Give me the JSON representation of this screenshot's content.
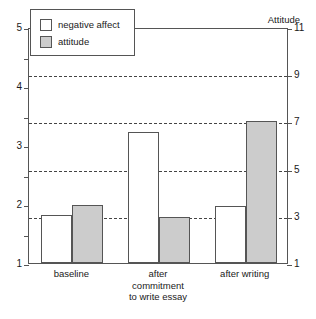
{
  "chart_data": {
    "type": "bar",
    "title": "",
    "categories": [
      "baseline",
      "after\ncommitment\nto write essay",
      "after writing"
    ],
    "series": [
      {
        "name": "negative affect",
        "axis": "left",
        "values": [
          1.82,
          3.22,
          1.97
        ],
        "fill": "#ffffff"
      },
      {
        "name": "attitude",
        "axis": "right",
        "values": [
          3.45,
          2.95,
          7.0
        ],
        "fill": "#cccccc"
      }
    ],
    "left_axis": {
      "label": "Negative Affect",
      "ticks": [
        5,
        4,
        3,
        2,
        1
      ],
      "minor_ticks": [
        4.5,
        3.5,
        2.5,
        1.5
      ],
      "ylim": [
        1,
        5
      ]
    },
    "right_axis": {
      "label": "Attitude",
      "ticks": [
        11,
        9,
        7,
        5,
        3,
        1
      ],
      "ylim": [
        1,
        11
      ]
    },
    "gridlines_right_values": [
      9,
      7,
      5,
      3
    ],
    "grid": true,
    "legend": {
      "position": "upper-left-inside",
      "entries": [
        "negative affect",
        "attitude"
      ]
    },
    "xlabel": "",
    "ylabel": "Negative Affect"
  },
  "axes": {
    "left_caption": "Negative Affect",
    "right_caption": "Attitude",
    "left_tick_labels": [
      "5",
      "4",
      "3",
      "2",
      "1"
    ],
    "right_tick_labels": [
      "11",
      "9",
      "7",
      "5",
      "3",
      "1"
    ]
  },
  "legend": {
    "items": [
      {
        "label": "negative affect",
        "swatch": "white-square"
      },
      {
        "label": "attitude",
        "swatch": "gray-square"
      }
    ]
  },
  "categories": [
    {
      "label": "baseline"
    },
    {
      "label": "after\ncommitment\nto write essay"
    },
    {
      "label": "after writing"
    }
  ],
  "colors": {
    "affect_fill": "#ffffff",
    "attitude_fill": "#cccccc",
    "line": "#555555",
    "text": "#1a1a1a"
  }
}
